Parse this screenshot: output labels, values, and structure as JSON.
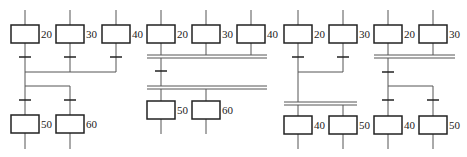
{
  "colors": {
    "line": "#555555",
    "box": "#222222",
    "bar": "#222222"
  },
  "diagrams": [
    {
      "id": "a",
      "description": "Selection convergence then selection divergence",
      "top_steps": [
        {
          "label": "20",
          "x": 25
        },
        {
          "label": "30",
          "x": 70
        },
        {
          "label": "40",
          "x": 116
        }
      ],
      "bottom_steps": [
        {
          "label": "50",
          "x": 25
        },
        {
          "label": "60",
          "x": 70
        }
      ]
    },
    {
      "id": "b",
      "description": "Simultaneous convergence then simultaneous divergence",
      "top_steps": [
        {
          "label": "20",
          "x": 161
        },
        {
          "label": "30",
          "x": 206
        },
        {
          "label": "40",
          "x": 251
        }
      ],
      "bottom_steps": [
        {
          "label": "50",
          "x": 161
        },
        {
          "label": "60",
          "x": 206
        }
      ]
    },
    {
      "id": "c",
      "description": "Selection convergence then simultaneous divergence",
      "top_steps": [
        {
          "label": "20",
          "x": 298
        },
        {
          "label": "30",
          "x": 343
        }
      ],
      "bottom_steps": [
        {
          "label": "40",
          "x": 298
        },
        {
          "label": "50",
          "x": 343
        }
      ]
    },
    {
      "id": "d",
      "description": "Simultaneous convergence then selection divergence",
      "top_steps": [
        {
          "label": "20",
          "x": 388
        },
        {
          "label": "30",
          "x": 433
        }
      ],
      "bottom_steps": [
        {
          "label": "40",
          "x": 388
        },
        {
          "label": "50",
          "x": 433
        }
      ]
    }
  ]
}
